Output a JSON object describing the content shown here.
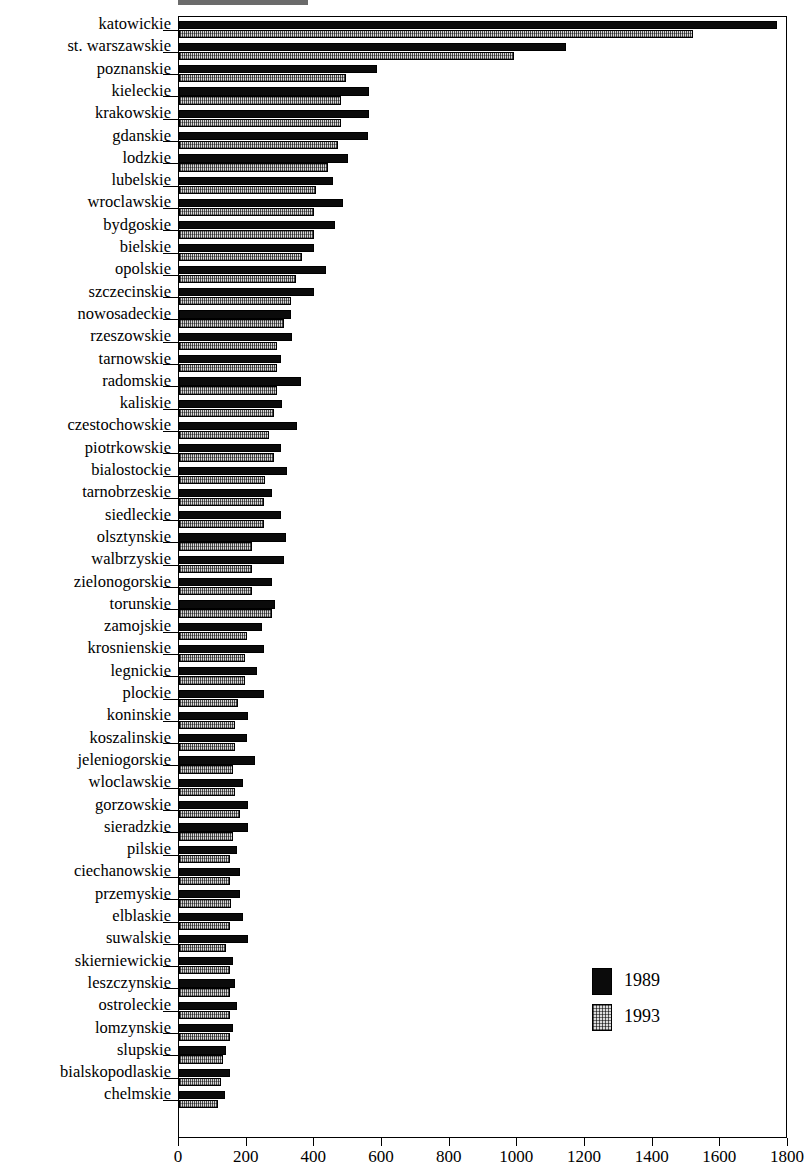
{
  "chart_data": {
    "type": "bar",
    "orientation": "horizontal",
    "title": "",
    "xlabel": "",
    "ylabel": "",
    "xlim": [
      0,
      1800
    ],
    "xticks": [
      0,
      200,
      400,
      600,
      800,
      1000,
      1200,
      1400,
      1600,
      1800
    ],
    "grid": false,
    "legend_position": "inside-lower-right",
    "categories": [
      "katowickie",
      "st. warszawskie",
      "poznanskie",
      "kieleckie",
      "krakowskie",
      "gdanskie",
      "lodzkie",
      "lubelskie",
      "wroclawskie",
      "bydgoskie",
      "bielskie",
      "opolskie",
      "szczecinskie",
      "nowosadeckie",
      "rzeszowskie",
      "tarnowskie",
      "radomskie",
      "kaliskie",
      "czestochowskie",
      "piotrkowskie",
      "bialostockie",
      "tarnobrzeskie",
      "siedleckie",
      "olsztynskie",
      "walbrzyskie",
      "zielonogorskie",
      "torunskie",
      "zamojskie",
      "krosnienskie",
      "legnickie",
      "plockie",
      "koninskie",
      "koszalinskie",
      "jeleniogorskie",
      "wloclawskie",
      "gorzowskie",
      "sieradzkie",
      "pilskie",
      "ciechanowskie",
      "przemyskie",
      "elblaskie",
      "suwalskie",
      "skierniewickie",
      "leszczynskie",
      "ostroleckie",
      "lomzynskie",
      "slupskie",
      "bialskopodlaskie",
      "chelmskie"
    ],
    "series": [
      {
        "name": "1989",
        "color": "#0b0b0b",
        "values": [
          1768,
          1144,
          585,
          562,
          563,
          560,
          500,
          455,
          485,
          460,
          400,
          435,
          400,
          330,
          335,
          300,
          360,
          305,
          350,
          300,
          320,
          275,
          300,
          315,
          310,
          275,
          285,
          245,
          250,
          230,
          250,
          205,
          200,
          225,
          190,
          205,
          205,
          170,
          180,
          180,
          190,
          205,
          160,
          165,
          170,
          160,
          140,
          150,
          135
        ]
      },
      {
        "name": "1993",
        "color": "#d8d8d8",
        "values": [
          1519,
          990,
          494,
          480,
          478,
          470,
          440,
          405,
          400,
          400,
          365,
          345,
          330,
          310,
          290,
          290,
          290,
          280,
          265,
          280,
          255,
          250,
          250,
          215,
          215,
          215,
          275,
          200,
          195,
          195,
          175,
          165,
          165,
          160,
          165,
          180,
          160,
          150,
          150,
          155,
          150,
          140,
          150,
          150,
          150,
          150,
          130,
          125,
          115
        ]
      }
    ]
  },
  "legend": {
    "entries": [
      {
        "label": "1989",
        "swatch": "legend-swatch-1989"
      },
      {
        "label": "1993",
        "swatch": "legend-swatch-1993"
      }
    ]
  }
}
